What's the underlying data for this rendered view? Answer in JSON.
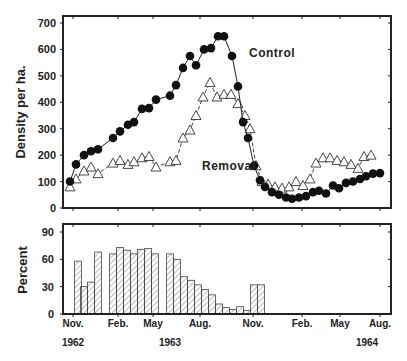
{
  "chart_data": [
    {
      "type": "line",
      "title": "",
      "ylabel": "Density per ha.",
      "xlabel": "",
      "ylim": [
        0,
        700
      ],
      "yticks": [
        0,
        100,
        200,
        300,
        400,
        500,
        600,
        700
      ],
      "xtick_labels": [
        "Nov.",
        "Feb.",
        "May",
        "Aug.",
        "Nov.",
        "Feb.",
        "May",
        "Aug."
      ],
      "year_labels": [
        "1962",
        "1963",
        "1964"
      ],
      "annotations": [
        "Control",
        "Removal"
      ],
      "grid": false,
      "series": [
        {
          "name": "Control",
          "marker": "filled-circle",
          "line": "solid",
          "x": [
            70,
            76,
            84,
            91,
            98,
            113,
            120,
            128,
            134,
            142,
            149,
            156,
            170,
            176,
            183,
            190,
            196,
            204,
            211,
            218,
            224,
            232,
            238,
            243,
            248,
            254,
            260,
            265,
            272,
            279,
            286,
            292,
            299,
            306,
            313,
            319,
            326,
            333,
            339,
            346,
            353,
            360,
            366,
            373,
            380
          ],
          "values": [
            100,
            165,
            200,
            215,
            222,
            265,
            290,
            315,
            325,
            375,
            378,
            410,
            425,
            465,
            530,
            575,
            540,
            600,
            605,
            650,
            650,
            575,
            460,
            325,
            265,
            160,
            105,
            80,
            60,
            50,
            40,
            35,
            40,
            45,
            60,
            65,
            55,
            85,
            75,
            95,
            100,
            110,
            120,
            130,
            132
          ]
        },
        {
          "name": "Removal",
          "marker": "open-triangle",
          "line": "dashed",
          "x": [
            70,
            76,
            84,
            91,
            98,
            113,
            120,
            128,
            134,
            142,
            149,
            156,
            170,
            176,
            183,
            190,
            196,
            203,
            210,
            217,
            224,
            231,
            238,
            245,
            250,
            256,
            262,
            268,
            275,
            282,
            289,
            296,
            303,
            310,
            316,
            323,
            330,
            337,
            344,
            351,
            358,
            364,
            371
          ],
          "values": [
            80,
            110,
            140,
            155,
            130,
            170,
            180,
            165,
            175,
            190,
            195,
            155,
            175,
            180,
            265,
            295,
            350,
            420,
            475,
            420,
            430,
            430,
            395,
            350,
            300,
            160,
            100,
            90,
            80,
            75,
            80,
            100,
            85,
            110,
            170,
            190,
            190,
            180,
            175,
            165,
            150,
            195,
            200
          ]
        }
      ]
    },
    {
      "type": "bar",
      "title": "",
      "ylabel": "Percent",
      "ylim": [
        0,
        90
      ],
      "yticks": [
        0,
        30,
        60,
        90
      ],
      "xtick_labels": [
        "Nov.",
        "Feb.",
        "May",
        "Aug.",
        "Nov.",
        "Feb.",
        "May",
        "Aug."
      ],
      "year_labels": [
        "1962",
        "1963",
        "1964"
      ],
      "bar_style": "hatched",
      "x": [
        78,
        84,
        91,
        98,
        113,
        120,
        127,
        134,
        141,
        148,
        155,
        170,
        177,
        184,
        191,
        198,
        205,
        212,
        219,
        226,
        233,
        240,
        247,
        254,
        261
      ],
      "values": [
        58,
        30,
        35,
        68,
        66,
        73,
        70,
        66,
        71,
        72,
        66,
        66,
        60,
        41,
        37,
        32,
        27,
        21,
        11,
        7,
        5,
        8,
        4,
        32,
        32
      ]
    }
  ],
  "layout": {
    "upper": {
      "left": 63,
      "right": 391,
      "top": 16,
      "bottom": 208,
      "y0px": 208,
      "ypx_per_unit": 0.2643
    },
    "lower": {
      "left": 63,
      "right": 391,
      "top": 224,
      "bottom": 314,
      "y0px": 314,
      "ypx_per_unit": 0.911
    },
    "xtick_px": [
      73,
      118,
      153,
      200,
      253,
      302,
      340,
      380
    ],
    "year_px": [
      73,
      170,
      367
    ]
  }
}
